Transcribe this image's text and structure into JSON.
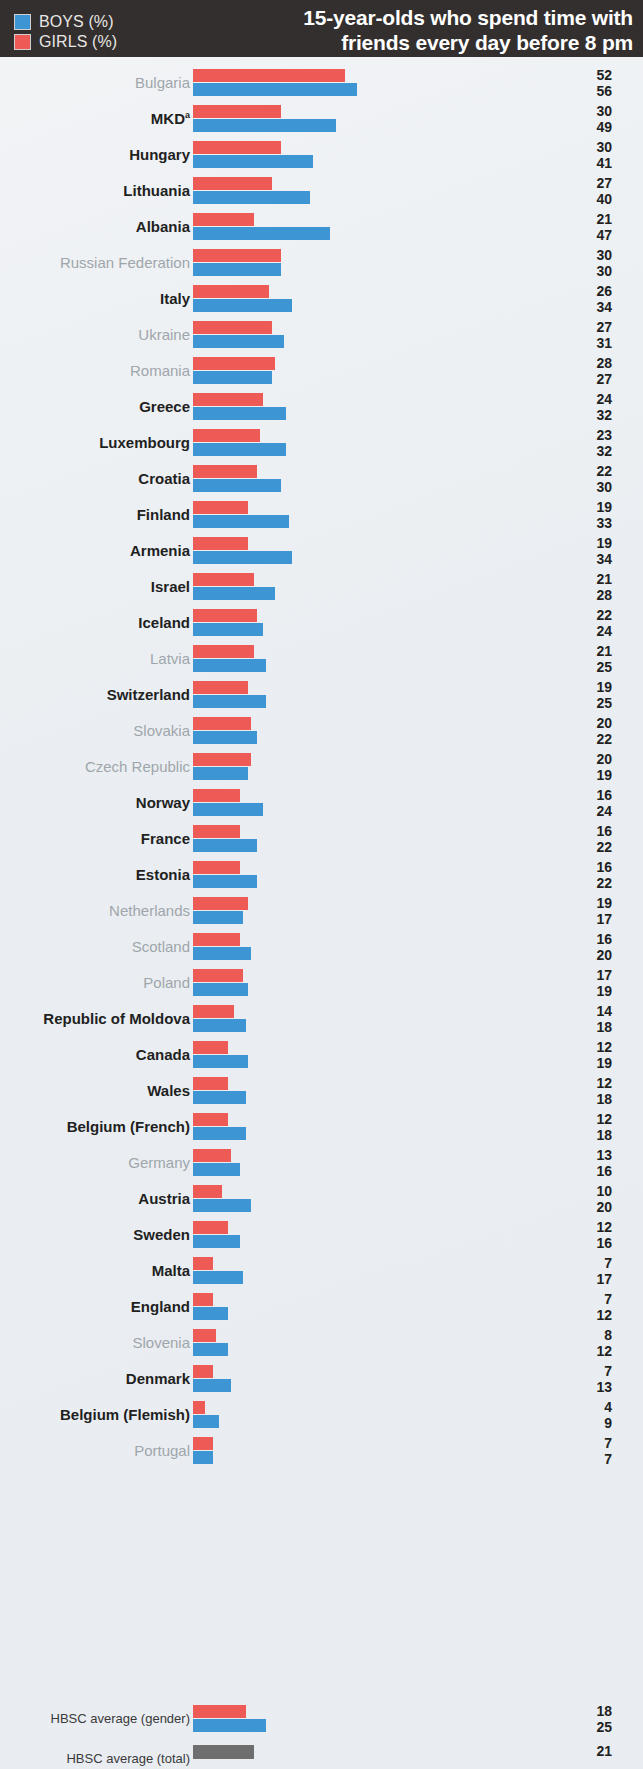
{
  "header": {
    "legend": [
      {
        "key": "boys",
        "label": "BOYS (%)",
        "color": "#3d95d4"
      },
      {
        "key": "girls",
        "label": "GIRLS (%)",
        "color": "#ee5b56"
      }
    ],
    "title_lines": [
      "15-year-olds who spend time with",
      "friends every day before 8 pm"
    ],
    "background": "#332f2e"
  },
  "chart_data": {
    "type": "bar",
    "orientation": "horizontal",
    "title": "15-year-olds who spend time with friends every day before 8 pm",
    "xlabel": "",
    "ylabel": "",
    "xlim": [
      0,
      60
    ],
    "grid": false,
    "legend_position": "top-left",
    "series": [
      {
        "name": "GIRLS (%)",
        "color": "#ee5b56"
      },
      {
        "name": "BOYS (%)",
        "color": "#3d95d4"
      }
    ],
    "categories": [
      "Bulgaria",
      "MKD",
      "Hungary",
      "Lithuania",
      "Albania",
      "Russian Federation",
      "Italy",
      "Ukraine",
      "Romania",
      "Greece",
      "Luxembourg",
      "Croatia",
      "Finland",
      "Armenia",
      "Israel",
      "Iceland",
      "Latvia",
      "Switzerland",
      "Slovakia",
      "Czech Republic",
      "Norway",
      "France",
      "Estonia",
      "Netherlands",
      "Scotland",
      "Poland",
      "Republic of Moldova",
      "Canada",
      "Wales",
      "Belgium (French)",
      "Germany",
      "Austria",
      "Sweden",
      "Malta",
      "England",
      "Slovenia",
      "Denmark",
      "Belgium (Flemish)",
      "Portugal"
    ],
    "girls": [
      52,
      30,
      30,
      27,
      21,
      30,
      26,
      27,
      28,
      24,
      23,
      22,
      19,
      19,
      21,
      22,
      21,
      19,
      20,
      20,
      16,
      16,
      16,
      19,
      16,
      17,
      14,
      12,
      12,
      12,
      13,
      10,
      12,
      7,
      7,
      8,
      7,
      4,
      7
    ],
    "boys": [
      56,
      49,
      41,
      40,
      47,
      30,
      34,
      31,
      27,
      32,
      32,
      30,
      33,
      34,
      28,
      24,
      25,
      25,
      22,
      19,
      24,
      22,
      22,
      17,
      20,
      19,
      18,
      19,
      18,
      18,
      16,
      20,
      16,
      17,
      12,
      12,
      13,
      9,
      7
    ],
    "averages": [
      {
        "label": "HBSC average (gender)",
        "girls": 18,
        "boys": 25
      },
      {
        "label": "HBSC average (total)",
        "total": 21,
        "color": "#6e6e6e"
      }
    ]
  },
  "rows": [
    {
      "label": "Bulgaria",
      "sup": "",
      "girls": 52,
      "boys": 56,
      "significant": false
    },
    {
      "label": "MKD",
      "sup": "a",
      "girls": 30,
      "boys": 49,
      "significant": true
    },
    {
      "label": "Hungary",
      "sup": "",
      "girls": 30,
      "boys": 41,
      "significant": true
    },
    {
      "label": "Lithuania",
      "sup": "",
      "girls": 27,
      "boys": 40,
      "significant": true
    },
    {
      "label": "Albania",
      "sup": "",
      "girls": 21,
      "boys": 47,
      "significant": true
    },
    {
      "label": "Russian Federation",
      "sup": "",
      "girls": 30,
      "boys": 30,
      "significant": false
    },
    {
      "label": "Italy",
      "sup": "",
      "girls": 26,
      "boys": 34,
      "significant": true
    },
    {
      "label": "Ukraine",
      "sup": "",
      "girls": 27,
      "boys": 31,
      "significant": false
    },
    {
      "label": "Romania",
      "sup": "",
      "girls": 28,
      "boys": 27,
      "significant": false
    },
    {
      "label": "Greece",
      "sup": "",
      "girls": 24,
      "boys": 32,
      "significant": true
    },
    {
      "label": "Luxembourg",
      "sup": "",
      "girls": 23,
      "boys": 32,
      "significant": true
    },
    {
      "label": "Croatia",
      "sup": "",
      "girls": 22,
      "boys": 30,
      "significant": true
    },
    {
      "label": "Finland",
      "sup": "",
      "girls": 19,
      "boys": 33,
      "significant": true
    },
    {
      "label": "Armenia",
      "sup": "",
      "girls": 19,
      "boys": 34,
      "significant": true
    },
    {
      "label": "Israel",
      "sup": "",
      "girls": 21,
      "boys": 28,
      "significant": true
    },
    {
      "label": "Iceland",
      "sup": "",
      "girls": 22,
      "boys": 24,
      "significant": true
    },
    {
      "label": "Latvia",
      "sup": "",
      "girls": 21,
      "boys": 25,
      "significant": false
    },
    {
      "label": "Switzerland",
      "sup": "",
      "girls": 19,
      "boys": 25,
      "significant": true
    },
    {
      "label": "Slovakia",
      "sup": "",
      "girls": 20,
      "boys": 22,
      "significant": false
    },
    {
      "label": "Czech Republic",
      "sup": "",
      "girls": 20,
      "boys": 19,
      "significant": false
    },
    {
      "label": "Norway",
      "sup": "",
      "girls": 16,
      "boys": 24,
      "significant": true
    },
    {
      "label": "France",
      "sup": "",
      "girls": 16,
      "boys": 22,
      "significant": true
    },
    {
      "label": "Estonia",
      "sup": "",
      "girls": 16,
      "boys": 22,
      "significant": true
    },
    {
      "label": "Netherlands",
      "sup": "",
      "girls": 19,
      "boys": 17,
      "significant": false
    },
    {
      "label": "Scotland",
      "sup": "",
      "girls": 16,
      "boys": 20,
      "significant": false
    },
    {
      "label": "Poland",
      "sup": "",
      "girls": 17,
      "boys": 19,
      "significant": false
    },
    {
      "label": "Republic of Moldova",
      "sup": "",
      "girls": 14,
      "boys": 18,
      "significant": true
    },
    {
      "label": "Canada",
      "sup": "",
      "girls": 12,
      "boys": 19,
      "significant": true
    },
    {
      "label": "Wales",
      "sup": "",
      "girls": 12,
      "boys": 18,
      "significant": true
    },
    {
      "label": "Belgium (French)",
      "sup": "",
      "girls": 12,
      "boys": 18,
      "significant": true
    },
    {
      "label": "Germany",
      "sup": "",
      "girls": 13,
      "boys": 16,
      "significant": false
    },
    {
      "label": "Austria",
      "sup": "",
      "girls": 10,
      "boys": 20,
      "significant": true
    },
    {
      "label": "Sweden",
      "sup": "",
      "girls": 12,
      "boys": 16,
      "significant": true
    },
    {
      "label": "Malta",
      "sup": "",
      "girls": 7,
      "boys": 17,
      "significant": true
    },
    {
      "label": "England",
      "sup": "",
      "girls": 7,
      "boys": 12,
      "significant": true
    },
    {
      "label": "Slovenia",
      "sup": "",
      "girls": 8,
      "boys": 12,
      "significant": false
    },
    {
      "label": "Denmark",
      "sup": "",
      "girls": 7,
      "boys": 13,
      "significant": true
    },
    {
      "label": "Belgium (Flemish)",
      "sup": "",
      "girls": 4,
      "boys": 9,
      "significant": true
    },
    {
      "label": "Portugal",
      "sup": "",
      "girls": 7,
      "boys": 7,
      "significant": false
    }
  ],
  "averages": [
    {
      "label": "HBSC average (gender)",
      "girls": 18,
      "boys": 25,
      "type": "gender"
    },
    {
      "label": "HBSC average (total)",
      "total": 21,
      "type": "total"
    }
  ],
  "colors": {
    "boys": "#3d95d4",
    "girls": "#ee5b56",
    "total": "#6e6e6e",
    "header_bg": "#332f2e",
    "page_bg": "#eef1f4",
    "label_muted": "#9fa6ab",
    "label_bold": "#221f1f"
  }
}
